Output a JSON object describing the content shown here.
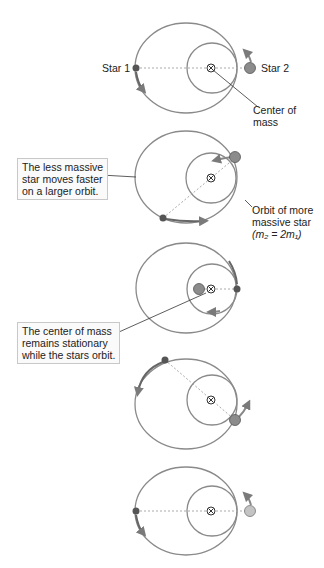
{
  "labels": {
    "star1": "Star 1",
    "star2": "Star 2",
    "center_of_mass_l1": "Center of",
    "center_of_mass_l2": "mass",
    "orbit_more_massive_l1": "Orbit of more",
    "orbit_more_massive_l2": "massive star",
    "orbit_more_massive_l3": "(m₂ = 2m₁)"
  },
  "callouts": {
    "less_massive": [
      "The less massive",
      "star moves faster",
      "on a larger orbit."
    ],
    "center_stationary": [
      "The center of mass",
      "remains stationary",
      "while the stars orbit."
    ]
  },
  "colors": {
    "orbit": "#8a8a8a",
    "arrow": "#7a7a7a",
    "star1": "#555555",
    "star2": "#8c8c8c",
    "star2_last": "#c4c4c4"
  },
  "panels": 5
}
